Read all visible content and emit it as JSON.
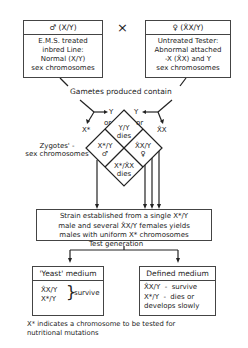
{
  "parents": {
    "male": {
      "header": "♂ (X/Y)",
      "lines": [
        "E.M.S. treated",
        "inbred Line:",
        "Normal (X/Y)",
        "sex chromosomes"
      ]
    },
    "cross_symbol": "×",
    "female": {
      "header": "♀ (X̂X/Y)",
      "lines": [
        "Untreated Tester:",
        "Abnormal attached",
        "-X (X̂X) and Y",
        "sex chromosomes"
      ]
    }
  },
  "gametes_label": "Gametes produced contain",
  "gametes": {
    "left_y": "Y",
    "left_or": "or",
    "left_x": "X*",
    "right_y": "Y",
    "right_or": "or",
    "right_x": "X̂X"
  },
  "zygotes_label": [
    "Zygotes' -",
    "sex chromosomes"
  ],
  "zygotes": {
    "top": [
      "Y/Y",
      "dies"
    ],
    "left": [
      "X*/Y",
      "♂"
    ],
    "right": [
      "X̂X/Y",
      "♀"
    ],
    "bottom": [
      "X*/X̂X",
      "dies"
    ]
  },
  "strain_box": [
    "Strain established from a single X*/Y",
    "male and several X̂X/Y females yields",
    "males with uniform X* chromosomes"
  ],
  "test_generation_label": "Test generation",
  "yeast_medium": {
    "header": "'Yeast' medium",
    "genotypes": [
      "X̂X/Y",
      "X*/Y"
    ],
    "result": "survive"
  },
  "defined_medium": {
    "header": "Defined medium",
    "lines": [
      "X̂X/Y  -  survive",
      "X*/Y  -  dies or",
      "develops slowly"
    ]
  },
  "footnote": [
    "X* indicates a chromosome to be tested for",
    "nutritional mutations"
  ]
}
